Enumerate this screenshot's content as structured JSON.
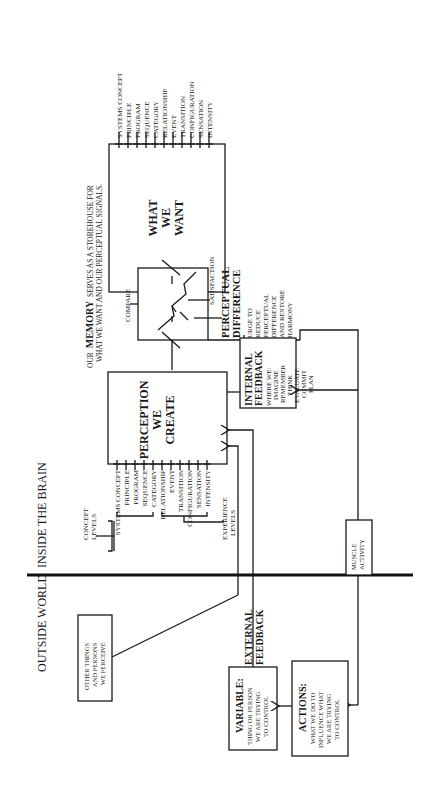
{
  "regions": {
    "outside": "OUTSIDE WORLD",
    "inside": "INSIDE THE BRAIN"
  },
  "memory": {
    "prefix": "OUR",
    "word": "MEMORY",
    "line1_rest": "SERVES AS A STOREHOUSE FOR",
    "line2": "WHAT WE WANT AND OUR PERCEPTUAL SIGNALS."
  },
  "want_box": {
    "lines": [
      "WHAT",
      "WE",
      "WANT"
    ],
    "levels": [
      "SYSTEMS CONCEPT",
      "PRINCIPLE",
      "PROGRAM",
      "SEQUENCE",
      "CATEGORY",
      "RELATIONSHIP",
      "EVENT",
      "TRANSITION",
      "CONFIGURATION",
      "SENSATION",
      "INTENSITY"
    ]
  },
  "compare": {
    "label": "COMPARE",
    "satisfaction": "SATISFACTION",
    "difference": [
      "PERCEPTUAL",
      "DIFFERENCE"
    ],
    "urge": [
      "URGE TO",
      "REDUCE",
      "PERCEPTUAL",
      "DIFFERENCE",
      "AND RESTORE",
      "HARMONY"
    ]
  },
  "perception_box": {
    "lines": [
      "PERCEPTION",
      "WE",
      "CREATE"
    ],
    "levels": [
      "SYSTEMS CONCEPT",
      "PRINCIPLE",
      "PROGRAM",
      "SEQUENCE",
      "CATEGORY",
      "RELATIONSHIP",
      "EVENT",
      "TRANSITION",
      "CONFIGURATION",
      "SENSATION",
      "INTENSITY"
    ],
    "concept_levels": [
      "CONCEPT",
      "LEVELS"
    ],
    "experience_levels": [
      "EXPERIENCE",
      "LEVELS"
    ]
  },
  "internal_feedback": {
    "title": [
      "INTERNAL",
      "FEEDBACK"
    ],
    "items": [
      "WHERE WE:",
      "IMAGINE",
      "REMEMBER",
      "THINK",
      "EVALUATE",
      "COMMIT",
      "PLAN"
    ]
  },
  "muscle": [
    "MUSCLE",
    "ACTIVITY"
  ],
  "external_feedback": [
    "EXTERNAL",
    "FEEDBACK"
  ],
  "other_things": [
    "OTHER THINGS",
    "AND PERSONS",
    "WE PERCEIVE"
  ],
  "variable": {
    "title": "VARIABLE:",
    "lines": [
      "THING OR PERSON",
      "WE ARE TRYING",
      "TO CONTROL"
    ]
  },
  "actions": {
    "title": "ACTIONS:",
    "lines": [
      "WHAT WE DO TO",
      "INFLUENCE WHAT",
      "WE ARE TRYING",
      "TO CONTROL"
    ]
  }
}
